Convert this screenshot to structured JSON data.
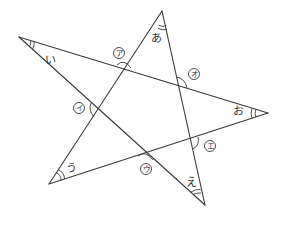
{
  "diagram": {
    "type": "pentagram-angle-figure",
    "line_color": "#3a3a3a",
    "background": "#ffffff",
    "vertices": {
      "top": {
        "x": 162,
        "y": 11
      },
      "left": {
        "x": 19,
        "y": 37
      },
      "right": {
        "x": 268,
        "y": 113
      },
      "bottom_left": {
        "x": 49,
        "y": 184
      },
      "bottom_right": {
        "x": 205,
        "y": 205
      }
    },
    "vertex_angle_labels": [
      {
        "id": "a",
        "text": "あ",
        "x": 156,
        "y": 38
      },
      {
        "id": "i",
        "text": "い",
        "x": 50,
        "y": 60
      },
      {
        "id": "u",
        "text": "う",
        "x": 71,
        "y": 168
      },
      {
        "id": "e",
        "text": "え",
        "x": 191,
        "y": 182
      },
      {
        "id": "o",
        "text": "お",
        "x": 238,
        "y": 111
      }
    ],
    "intersection_angle_labels": [
      {
        "id": "A",
        "text": "ア",
        "x": 119,
        "y": 53
      },
      {
        "id": "I",
        "text": "イ",
        "x": 79,
        "y": 108
      },
      {
        "id": "U",
        "text": "ウ",
        "x": 146,
        "y": 169
      },
      {
        "id": "E",
        "text": "エ",
        "x": 210,
        "y": 146
      },
      {
        "id": "O",
        "text": "オ",
        "x": 194,
        "y": 74
      }
    ]
  }
}
